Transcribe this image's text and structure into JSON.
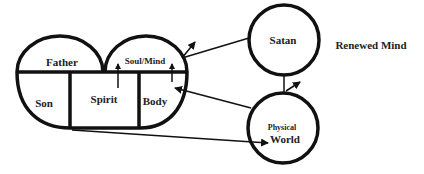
{
  "diagram": {
    "colors": {
      "stroke": "#111111",
      "text": "#222222",
      "background": "#ffffff"
    },
    "nodes": {
      "father": "Father",
      "soul_mind": "Soul/Mind",
      "son": "Son",
      "spirit": "Spirit",
      "body": "Body",
      "satan": "Satan",
      "physical": "Physical",
      "world": "World",
      "renewed_mind": "Renewed Mind"
    },
    "edges": [
      {
        "from": "spirit",
        "to": "soul_mind",
        "type": "arrow"
      },
      {
        "from": "body",
        "to": "soul_mind",
        "type": "arrow"
      },
      {
        "from": "satan",
        "to": "soul_mind",
        "type": "line-with-arrow-outward"
      },
      {
        "from": "physical_world",
        "to": "body",
        "type": "arrow"
      },
      {
        "from": "spirit",
        "to": "physical_world",
        "type": "arrow"
      },
      {
        "from": "satan",
        "to": "physical_world",
        "type": "line-with-arrow"
      }
    ]
  }
}
